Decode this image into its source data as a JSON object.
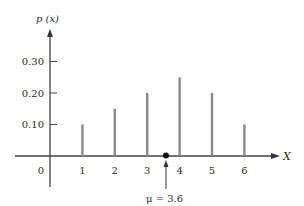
{
  "chart_data": {
    "type": "bar",
    "title": "",
    "xlabel": "X",
    "ylabel": "p (x)",
    "categories": [
      "1",
      "2",
      "3",
      "4",
      "5",
      "6"
    ],
    "x": [
      1,
      2,
      3,
      4,
      5,
      6
    ],
    "values": [
      0.1,
      0.15,
      0.2,
      0.25,
      0.2,
      0.1
    ],
    "x_tick_labels": [
      "0",
      "1",
      "2",
      "3",
      "4",
      "5",
      "6"
    ],
    "y_tick_labels": [
      "0.10",
      "0.20",
      "0.30"
    ],
    "y_ticks": [
      0.1,
      0.2,
      0.3
    ],
    "ylim": [
      0,
      0.36
    ],
    "xlim": [
      -1,
      7
    ],
    "grid": false,
    "legend": null,
    "annotations": [
      {
        "text": "μ = 3.6",
        "x": 3.6,
        "y": 0,
        "style": "arrow pointing up to dot on x-axis"
      }
    ],
    "bar_color": "#8a8a8a",
    "axis_color": "#444444"
  },
  "labels": {
    "y_axis": "p (x)",
    "x_axis": "X",
    "mean": "μ = 3.6",
    "origin": "0"
  }
}
